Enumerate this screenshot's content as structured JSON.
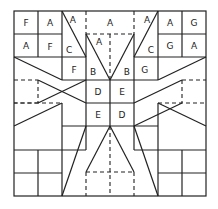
{
  "diagram": {
    "type": "quilt-block-pattern",
    "grid": {
      "columns": 8,
      "rows": 8
    },
    "colors": {
      "line": "#222222",
      "background": "#ffffff"
    },
    "labels": [
      {
        "text": "F",
        "col": 0.5,
        "row": 0.5
      },
      {
        "text": "A",
        "col": 1.5,
        "row": 0.5
      },
      {
        "text": "A",
        "col": 0.5,
        "row": 1.5
      },
      {
        "text": "F",
        "col": 1.5,
        "row": 1.55
      },
      {
        "text": "A",
        "col": 2.45,
        "row": 0.4
      },
      {
        "text": "C",
        "col": 2.3,
        "row": 1.7
      },
      {
        "text": "A",
        "col": 4.0,
        "row": 0.5
      },
      {
        "text": "A",
        "col": 3.55,
        "row": 1.35
      },
      {
        "text": "A",
        "col": 5.55,
        "row": 0.4
      },
      {
        "text": "C",
        "col": 5.7,
        "row": 1.7
      },
      {
        "text": "A",
        "col": 6.5,
        "row": 0.5
      },
      {
        "text": "G",
        "col": 7.5,
        "row": 0.5
      },
      {
        "text": "G",
        "col": 6.5,
        "row": 1.5
      },
      {
        "text": "A",
        "col": 7.5,
        "row": 1.5
      },
      {
        "text": "F",
        "col": 2.5,
        "row": 2.55
      },
      {
        "text": "B",
        "col": 3.3,
        "row": 2.65
      },
      {
        "text": "B",
        "col": 4.7,
        "row": 2.65
      },
      {
        "text": "G",
        "col": 5.45,
        "row": 2.55
      },
      {
        "text": "D",
        "col": 3.5,
        "row": 3.5
      },
      {
        "text": "E",
        "col": 4.5,
        "row": 3.5
      },
      {
        "text": "E",
        "col": 3.5,
        "row": 4.5
      },
      {
        "text": "D",
        "col": 4.5,
        "row": 4.5
      }
    ]
  }
}
